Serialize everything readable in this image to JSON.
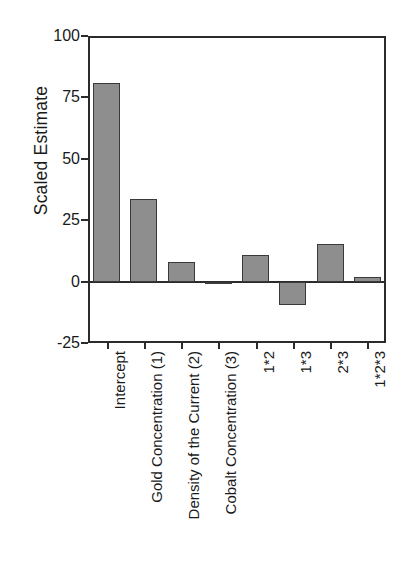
{
  "chart_data": {
    "type": "bar",
    "title": "",
    "subtitle": "",
    "xlabel": "",
    "ylabel": "Scaled Estimate",
    "ylim": [
      -25,
      100
    ],
    "yticks": [
      100,
      75,
      50,
      25,
      0,
      -25
    ],
    "ytick_labels": [
      "100",
      "75",
      "50",
      "25",
      "0",
      "-25"
    ],
    "grid": false,
    "legend": null,
    "zero_line": true,
    "bar_color": "#8e8e8e",
    "bar_edge_color": "#3a3a3a",
    "axis_color": "#2b2b2b",
    "background_color": "#ffffff",
    "categories": [
      "Intercept",
      "Gold Concentration (1)",
      "Density of the Current (2)",
      "Cobalt Concentration (3)",
      "1*2",
      "1*3",
      "2*3",
      "1*2*3"
    ],
    "values": [
      81,
      33.5,
      8,
      0,
      11,
      -9.5,
      15.5,
      2
    ]
  }
}
